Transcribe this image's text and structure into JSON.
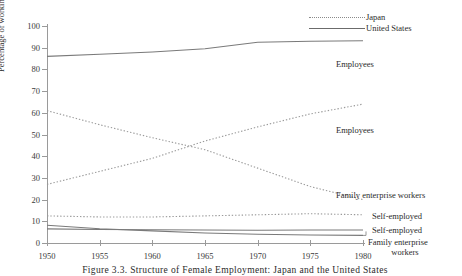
{
  "chart_data": {
    "type": "line",
    "title": "",
    "xlabel": "",
    "ylabel": "Percentage of working women",
    "xlim": [
      1950,
      1980
    ],
    "ylim": [
      0,
      100
    ],
    "grid": false,
    "legend_position": "top-right",
    "x": [
      1950,
      1955,
      1960,
      1965,
      1970,
      1975,
      1980
    ],
    "xticks": [
      "1950",
      "1955",
      "1960",
      "1965",
      "1970",
      "1975",
      "1980"
    ],
    "yticks": [
      "0",
      "10",
      "20",
      "30",
      "40",
      "50",
      "60",
      "70",
      "80",
      "90",
      "100"
    ],
    "legend": [
      {
        "name": "Japan",
        "style": "dotted"
      },
      {
        "name": "United States",
        "style": "solid"
      }
    ],
    "series": [
      {
        "name": "United States Employees",
        "country": "United States",
        "category": "Employees",
        "style": "solid",
        "values": [
          86,
          87,
          88,
          89.5,
          92.5,
          93,
          93.2
        ]
      },
      {
        "name": "Japan Employees",
        "country": "Japan",
        "category": "Employees",
        "style": "dotted",
        "values": [
          27,
          33,
          39,
          47,
          53.5,
          59.5,
          64
        ]
      },
      {
        "name": "Japan Family enterprise workers",
        "country": "Japan",
        "category": "Family enterprise workers",
        "style": "dotted",
        "values": [
          61,
          54.5,
          48.5,
          43,
          34.5,
          26,
          20
        ]
      },
      {
        "name": "Japan Self-employed",
        "country": "Japan",
        "category": "Self-employed",
        "style": "dotted",
        "values": [
          12.5,
          12,
          12,
          12.5,
          13,
          13.5,
          13
        ]
      },
      {
        "name": "United States Self-employed",
        "country": "United States",
        "category": "Self-employed",
        "style": "solid",
        "values": [
          6.5,
          6.2,
          6.1,
          6.0,
          5.9,
          6.0,
          6.0
        ]
      },
      {
        "name": "United States Family enterprise workers",
        "country": "United States",
        "category": "Family enterprise workers",
        "style": "solid",
        "values": [
          8.2,
          6.6,
          5.6,
          4.6,
          4.0,
          3.7,
          3.5
        ]
      }
    ],
    "annotations": [
      {
        "text": "Employees",
        "series": "United States Employees"
      },
      {
        "text": "Employees",
        "series": "Japan Employees"
      },
      {
        "text": "Family enterprise workers",
        "series": "Japan Family enterprise workers"
      },
      {
        "text": "Self-employed",
        "series": "Japan Self-employed"
      },
      {
        "text": "Self-employed",
        "series": "United States Self-employed"
      },
      {
        "text": "Family enterprise",
        "series": "United States Family enterprise workers"
      },
      {
        "text": "workers",
        "series": "United States Family enterprise workers"
      }
    ]
  },
  "caption": "Figure 3.3. Structure of Female Employment: Japan and the United States"
}
